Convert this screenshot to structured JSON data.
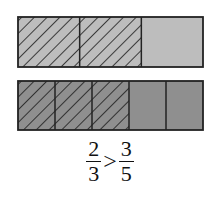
{
  "diagram": {
    "colors": {
      "top_fill": "#bdbdbd",
      "bottom_fill": "#8f8f8f",
      "stroke": "#222222",
      "hatch": "#1a1a1a"
    },
    "bars": [
      {
        "name": "thirds",
        "denominator": 3,
        "shaded": 2
      },
      {
        "name": "fifths",
        "denominator": 5,
        "shaded": 3
      }
    ],
    "expression": {
      "left": {
        "numerator": "2",
        "denominator": "3"
      },
      "operator": ">",
      "right": {
        "numerator": "3",
        "denominator": "5"
      }
    }
  }
}
